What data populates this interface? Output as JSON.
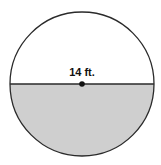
{
  "figure": {
    "shape": "circle",
    "shaded_region": "lower semicircle",
    "diameter_label": "14 ft.",
    "center_marked": true
  },
  "colors": {
    "outline": "#2a2a2a",
    "shade": "#cfcfcf",
    "background": "#ffffff",
    "center_dot": "#111111"
  }
}
